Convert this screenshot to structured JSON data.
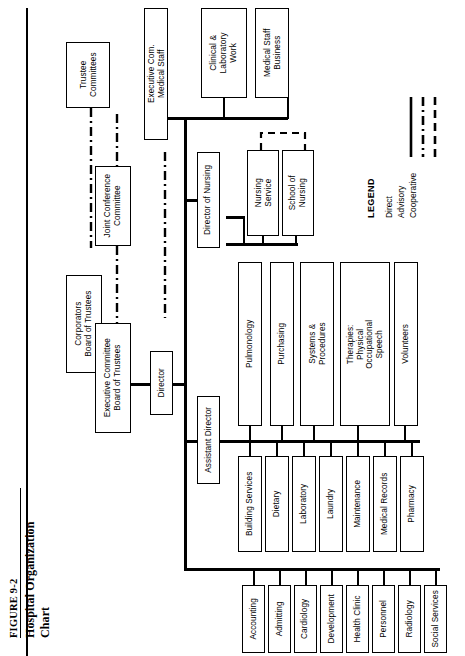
{
  "figure": {
    "number": "FIGURE 9-2",
    "title": "Hospital Organization Chart"
  },
  "legend": {
    "title": "LEGEND",
    "items": [
      {
        "label": "Direct",
        "style": "solid"
      },
      {
        "label": "Advisory",
        "style": "dash-dot"
      },
      {
        "label": "Cooperative",
        "style": "dashed"
      }
    ]
  },
  "nodes": {
    "trustee_committees": "Trustee\nCommittees",
    "executive_com_medical_staff": "Executive Com.\nMedical Staff",
    "clinical_laboratory_work": "Clinical &\nLaboratory\nWork",
    "medical_staff_business": "Medical Staff\nBusiness",
    "joint_conference_committee": "Joint Conference\nCommittee",
    "corporators_board_of_trustees": "Corporators\nBoard of Trustees",
    "executive_committee_board_of_trustees": "Executive Committee\nBoard of Trustees",
    "director": "Director",
    "director_of_nursing": "Director of Nursing",
    "nursing_service": "Nursing\nService",
    "school_of_nursing": "School of\nNursing",
    "assistant_director": "Assistant Director"
  },
  "departments_upper": [
    "Pulmonology",
    "Purchasing",
    "Systems &\nProcedures",
    "Therapies:\nPhysical\nOccupational\nSpeech",
    "Volunteers"
  ],
  "departments_lower": [
    "Building Services",
    "Dietary",
    "Laboratory",
    "Laundry",
    "Maintenance",
    "Medical Records",
    "Pharmacy"
  ],
  "departments_bottom": [
    "Accounting",
    "Admitting",
    "Cardiology",
    "Development",
    "Health Clinic",
    "Personnel",
    "Radiology",
    "Social Services"
  ],
  "colors": {
    "line": "#000000",
    "background": "#ffffff",
    "box_border": "#000000"
  }
}
